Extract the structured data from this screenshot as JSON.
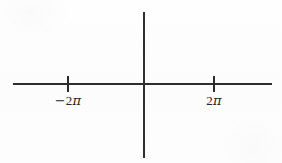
{
  "figure": {
    "background_color": "#fdfdfd",
    "line_color": "#2e2e2e",
    "text_color": "#262626",
    "width": 282,
    "height": 163
  },
  "axes": {
    "x_axis": {
      "label": "x-axis",
      "y_position": 84,
      "x_start": 13,
      "x_end": 272,
      "thickness": 1.6
    },
    "y_axis": {
      "label": "y-axis",
      "x_position": 144,
      "y_start": 12,
      "y_end": 158,
      "thickness": 1.6
    },
    "origin": {
      "x": 144,
      "y": 84
    }
  },
  "ticks": [
    {
      "name": "tick-negative-two-pi",
      "x": 68,
      "label_minus": "−",
      "label_number": "2",
      "label_symbol": "π",
      "label_full": "−2π",
      "value": "-2pi"
    },
    {
      "name": "tick-two-pi",
      "x": 214,
      "label_minus": "",
      "label_number": "2",
      "label_symbol": "π",
      "label_full": "2π",
      "value": "2pi"
    }
  ],
  "chart_data": {
    "type": "line",
    "title": "",
    "subtitle": "",
    "xlabel": "",
    "ylabel": "",
    "grid": false,
    "legend": "none",
    "x_tick_labels": [
      "−2π",
      "2π"
    ],
    "x_tick_values": [
      -6.283185,
      6.283185
    ],
    "y_tick_labels": [],
    "y_tick_values": [],
    "xlim": [
      -11.3,
      11.0
    ],
    "ylim": [
      -3.2,
      3.1
    ],
    "series": []
  }
}
